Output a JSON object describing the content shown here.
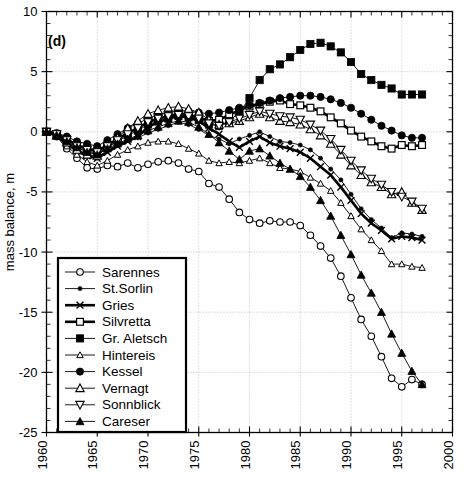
{
  "panel_label": "(d)",
  "axes": {
    "ylabel": "mass balance, m",
    "xlabel": "",
    "ytick_labels": [
      "10",
      "5",
      "0",
      "-5",
      "-10",
      "-15",
      "-20",
      "-25"
    ],
    "xtick_labels": [
      "1960",
      "1965",
      "1970",
      "1975",
      "1980",
      "1985",
      "1990",
      "1995",
      "2000"
    ]
  },
  "legend": {
    "items": [
      {
        "label": "Sarennes",
        "marker": "open-circle",
        "bold": false
      },
      {
        "label": "St.Sorlin",
        "marker": "small-filled-circle",
        "bold": false
      },
      {
        "label": "Gries",
        "marker": "x-cross",
        "bold": true
      },
      {
        "label": "Silvretta",
        "marker": "open-square",
        "bold": true
      },
      {
        "label": "Gr. Aletsch",
        "marker": "filled-square",
        "bold": false
      },
      {
        "label": "Hintereis",
        "marker": "small-open-triangle",
        "bold": false
      },
      {
        "label": "Kessel",
        "marker": "filled-circle",
        "bold": false
      },
      {
        "label": "Vernagt",
        "marker": "open-triangle",
        "bold": false
      },
      {
        "label": "Sonnblick",
        "marker": "open-down-triangle",
        "bold": false
      },
      {
        "label": "Careser",
        "marker": "filled-triangle",
        "bold": false
      }
    ]
  },
  "chart_data": {
    "type": "line",
    "title": "",
    "xlabel": "",
    "ylabel": "mass balance, m",
    "xlim": [
      1960,
      2000
    ],
    "ylim": [
      -25,
      10
    ],
    "grid": true,
    "legend_position": "lower-left",
    "xticks": [
      1960,
      1965,
      1970,
      1975,
      1980,
      1985,
      1990,
      1995,
      2000
    ],
    "yticks": [
      10,
      5,
      0,
      -5,
      -10,
      -15,
      -20,
      -25
    ],
    "x": [
      1960,
      1961,
      1962,
      1963,
      1964,
      1965,
      1966,
      1967,
      1968,
      1969,
      1970,
      1971,
      1972,
      1973,
      1974,
      1975,
      1976,
      1977,
      1978,
      1979,
      1980,
      1981,
      1982,
      1983,
      1984,
      1985,
      1986,
      1987,
      1988,
      1989,
      1990,
      1991,
      1992,
      1993,
      1994,
      1995,
      1996,
      1997
    ],
    "series": [
      {
        "name": "Sarennes",
        "marker": "open-circle",
        "values": [
          0.0,
          -0.4,
          -1.4,
          -2.2,
          -3.0,
          -3.1,
          -2.8,
          -2.9,
          -2.6,
          -3.0,
          -2.7,
          -2.5,
          -2.4,
          -2.6,
          -3.1,
          -3.3,
          -4.3,
          -4.6,
          -5.6,
          -6.7,
          -7.3,
          -7.6,
          -7.4,
          -7.5,
          -7.5,
          -7.8,
          -8.6,
          -9.5,
          -10.5,
          -12.0,
          -13.8,
          -15.6,
          -17.0,
          -18.7,
          -20.5,
          -21.2,
          -20.6,
          -21.0
        ]
      },
      {
        "name": "St.Sorlin",
        "marker": "small-filled-circle",
        "values": [
          0.0,
          -0.3,
          -0.9,
          -1.4,
          -1.9,
          -2.2,
          -1.5,
          -1.1,
          -0.7,
          -0.5,
          -0.1,
          0.2,
          0.5,
          0.8,
          0.6,
          0.2,
          -0.3,
          -0.6,
          -1.0,
          -0.6,
          -0.3,
          0.0,
          -0.4,
          -0.8,
          -0.9,
          -1.1,
          -1.5,
          -2.2,
          -3.1,
          -4.0,
          -5.2,
          -6.4,
          -7.3,
          -8.0,
          -8.8,
          -8.4,
          -8.5,
          -8.7
        ]
      },
      {
        "name": "Gries",
        "marker": "x-cross",
        "bold": true,
        "values": [
          0.0,
          -0.3,
          -1.0,
          -1.6,
          -2.0,
          -2.2,
          -1.7,
          -1.2,
          -0.8,
          -0.4,
          0.4,
          0.8,
          1.1,
          1.3,
          1.2,
          0.9,
          0.3,
          -0.2,
          -0.8,
          -1.3,
          -0.8,
          -0.4,
          -0.9,
          -1.2,
          -1.4,
          -1.7,
          -2.2,
          -2.9,
          -3.6,
          -4.6,
          -5.7,
          -6.8,
          -7.6,
          -8.2,
          -8.9,
          -8.7,
          -8.8,
          -9.0
        ]
      },
      {
        "name": "Silvretta",
        "marker": "open-square",
        "bold": true,
        "values": [
          0.0,
          -0.2,
          -0.6,
          -1.1,
          -1.4,
          -1.6,
          -1.1,
          -0.6,
          -0.1,
          0.3,
          0.8,
          1.1,
          1.3,
          1.5,
          1.4,
          1.2,
          0.9,
          1.0,
          1.4,
          1.8,
          2.1,
          2.3,
          2.5,
          2.6,
          2.3,
          2.2,
          2.0,
          1.7,
          1.2,
          0.7,
          0.1,
          -0.4,
          -0.8,
          -1.2,
          -1.4,
          -1.1,
          -1.2,
          -1.1
        ]
      },
      {
        "name": "Gr. Aletsch",
        "marker": "filled-square",
        "values": [
          0.0,
          -0.2,
          -0.8,
          -1.3,
          -1.6,
          -1.8,
          -1.3,
          -0.8,
          -0.3,
          0.1,
          0.6,
          0.9,
          1.1,
          1.3,
          1.2,
          1.0,
          0.6,
          0.5,
          0.9,
          1.6,
          2.8,
          4.3,
          5.2,
          5.6,
          6.2,
          6.8,
          7.3,
          7.4,
          7.1,
          6.6,
          5.8,
          4.8,
          4.3,
          3.9,
          3.6,
          3.1,
          3.1,
          3.1
        ]
      },
      {
        "name": "Hintereis",
        "marker": "small-open-triangle",
        "values": [
          0.0,
          -0.4,
          -1.2,
          -1.9,
          -2.5,
          -2.8,
          -2.4,
          -1.9,
          -1.5,
          -1.2,
          -0.9,
          -0.8,
          -0.8,
          -1.0,
          -1.4,
          -1.8,
          -2.4,
          -2.6,
          -2.5,
          -2.6,
          -2.4,
          -2.2,
          -2.6,
          -3.0,
          -3.1,
          -3.3,
          -3.8,
          -4.3,
          -4.9,
          -5.9,
          -7.0,
          -8.1,
          -9.0,
          -9.9,
          -11.0,
          -11.0,
          -11.2,
          -11.3
        ]
      },
      {
        "name": "Kessel",
        "marker": "filled-circle",
        "values": [
          0.0,
          -0.1,
          -0.4,
          -0.8,
          -1.0,
          -1.2,
          -0.7,
          -0.2,
          0.3,
          0.7,
          1.1,
          1.4,
          1.6,
          1.8,
          1.7,
          1.6,
          1.5,
          1.6,
          1.8,
          2.0,
          2.2,
          2.4,
          2.6,
          2.8,
          2.9,
          3.0,
          3.0,
          2.9,
          2.7,
          2.4,
          2.0,
          1.5,
          1.0,
          0.5,
          0.1,
          -0.3,
          -0.5,
          -0.5
        ]
      },
      {
        "name": "Vernagt",
        "marker": "open-triangle",
        "values": [
          0.0,
          -0.3,
          -0.9,
          -1.5,
          -1.9,
          -2.0,
          -1.2,
          -0.5,
          0.3,
          0.9,
          1.5,
          1.8,
          2.0,
          2.1,
          1.9,
          1.6,
          1.0,
          0.6,
          0.7,
          0.9,
          1.2,
          1.5,
          1.2,
          0.9,
          0.8,
          0.6,
          0.2,
          -0.3,
          -1.0,
          -1.9,
          -2.8,
          -3.6,
          -4.2,
          -4.6,
          -5.2,
          -5.0,
          -5.9,
          -6.5
        ]
      },
      {
        "name": "Sonnblick",
        "marker": "open-down-triangle",
        "values": [
          0.0,
          -0.2,
          -0.7,
          -1.2,
          -1.5,
          -1.7,
          -1.2,
          -0.7,
          -0.2,
          0.3,
          0.8,
          1.1,
          1.3,
          1.4,
          1.3,
          1.1,
          0.7,
          0.5,
          0.8,
          1.1,
          1.4,
          1.7,
          1.5,
          1.3,
          1.2,
          1.0,
          0.6,
          0.1,
          -0.6,
          -1.5,
          -2.4,
          -3.2,
          -3.9,
          -4.4,
          -5.0,
          -5.4,
          -5.8,
          -6.4
        ]
      },
      {
        "name": "Careser",
        "marker": "filled-triangle",
        "values": [
          0.0,
          -0.3,
          -0.8,
          -1.3,
          -1.7,
          -1.9,
          -1.4,
          -1.0,
          -0.6,
          -0.3,
          0.1,
          0.4,
          0.7,
          0.9,
          0.8,
          0.4,
          -0.2,
          -0.9,
          -1.6,
          -2.3,
          -1.6,
          -1.4,
          -2.0,
          -2.6,
          -3.1,
          -3.7,
          -4.6,
          -5.7,
          -7.0,
          -8.6,
          -10.2,
          -11.9,
          -13.4,
          -15.0,
          -16.8,
          -18.4,
          -19.9,
          -21.0
        ]
      }
    ]
  }
}
